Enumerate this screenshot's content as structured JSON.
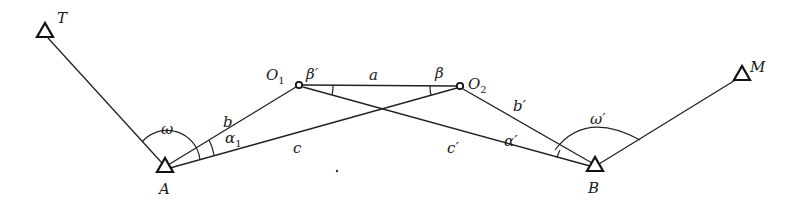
{
  "diagram": {
    "title": "",
    "stations": {
      "T": {
        "label": "T",
        "x": 45,
        "y": 34
      },
      "A": {
        "label": "A",
        "x": 165,
        "y": 168
      },
      "B": {
        "label": "B",
        "x": 595,
        "y": 167
      },
      "M": {
        "label": "M",
        "x": 740,
        "y": 76
      }
    },
    "points": {
      "O1": {
        "label": "O",
        "sub": "1",
        "x": 299,
        "y": 85
      },
      "O2": {
        "label": "O",
        "sub": "2",
        "x": 460,
        "y": 86
      }
    },
    "sides": {
      "a": "a",
      "b": "b",
      "c": "c",
      "b_prime": "b′",
      "c_prime": "c′"
    },
    "angles": {
      "omega": "ω",
      "omega_prime": "ω′",
      "alpha1": {
        "label": "α",
        "sub": "1"
      },
      "alpha_prime": "α′",
      "beta": "β",
      "beta_prime": "β′"
    },
    "edges": [
      [
        "T",
        "A"
      ],
      [
        "A",
        "O1"
      ],
      [
        "A",
        "O2"
      ],
      [
        "O1",
        "O2"
      ],
      [
        "O1",
        "B"
      ],
      [
        "O2",
        "B"
      ],
      [
        "B",
        "M"
      ]
    ]
  }
}
